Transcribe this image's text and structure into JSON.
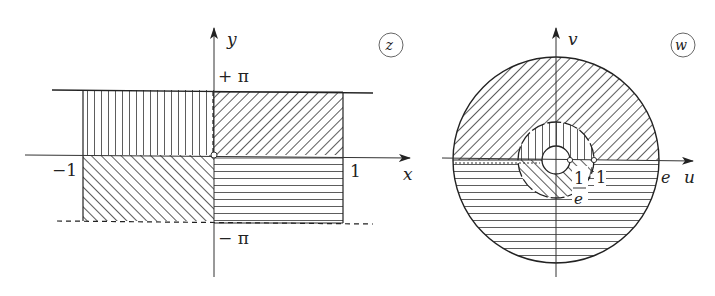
{
  "figure": {
    "z_plane": {
      "badge": "z",
      "x_axis_label": "x",
      "y_axis_label": "y",
      "tick_top": "+ π",
      "tick_bottom": "− π",
      "tick_left": "−1",
      "tick_right": "1",
      "regions": [
        {
          "name": "upper-left",
          "hatch": "vertical"
        },
        {
          "name": "upper-right",
          "hatch": "diagonal-forward"
        },
        {
          "name": "lower-left",
          "hatch": "diagonal-backward"
        },
        {
          "name": "lower-right",
          "hatch": "horizontal"
        }
      ]
    },
    "w_plane": {
      "badge": "w",
      "u_axis_label": "u",
      "v_axis_label": "v",
      "outer_radius_label": "e",
      "middle_radius_label": "1",
      "inner_radius_num": "1",
      "inner_radius_den": "e"
    },
    "colors": {
      "ink": "#222222",
      "background": "#ffffff"
    }
  }
}
